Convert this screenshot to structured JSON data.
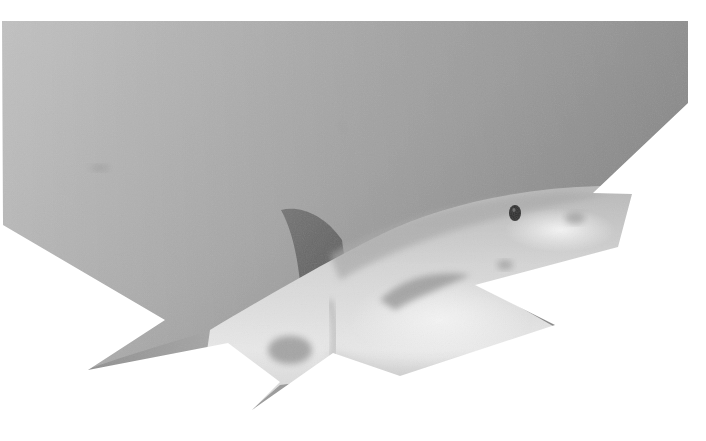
{
  "image": {
    "subject": "Great white shark swimming underwater, grayscale photo cut out as an irregular polygon",
    "alt": "Grayscale underwater photo of a great white shark",
    "colors": {
      "background": "#ffffff",
      "water_light": "#c4c4c4",
      "water_mid": "#ababab",
      "water_dark": "#8e8e8e",
      "fin_dark": "#6f6f6f",
      "belly_light": "#e6e6e6",
      "belly_white": "#f2f2f2",
      "shark_shadow": "#8a8a8a",
      "eye": "#2e2e2e"
    },
    "clip_polygon": "2,21 688,21 688,103 593,193 632,194 618,247 475,285 555,325 400,376 333,353 252,410 280,382 228,343 88,370 165,320 3,225"
  }
}
